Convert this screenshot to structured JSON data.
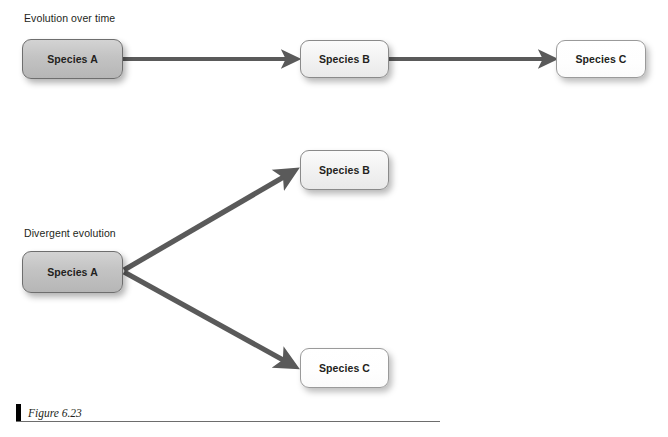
{
  "figure": {
    "caption": "Figure 6.23",
    "background_color": "#ffffff"
  },
  "colors": {
    "arrow": "#5a5a5a",
    "box_border_dark": "#6e6e6e",
    "box_border_light": "#9a9a9a",
    "box_fill_dark": "#c3c3c3",
    "box_fill_mid": "#f2f2f2",
    "box_fill_light": "#ffffff",
    "text": "#231f20",
    "caption_bar": "#000000",
    "caption_rule": "#6d6d6d"
  },
  "diagrams": [
    {
      "id": "linear-evolution",
      "label": "Evolution over time",
      "nodes": [
        {
          "id": "linear-species-a",
          "label": "Species A",
          "tone": "dark"
        },
        {
          "id": "linear-species-b",
          "label": "Species B",
          "tone": "mid"
        },
        {
          "id": "linear-species-c",
          "label": "Species C",
          "tone": "light"
        }
      ],
      "edges": [
        {
          "from": "Species A",
          "to": "Species B"
        },
        {
          "from": "Species B",
          "to": "Species C"
        }
      ]
    },
    {
      "id": "divergent-evolution",
      "label": "Divergent evolution",
      "nodes": [
        {
          "id": "divergent-species-a",
          "label": "Species A",
          "tone": "dark"
        },
        {
          "id": "divergent-species-b",
          "label": "Species B",
          "tone": "mid"
        },
        {
          "id": "divergent-species-c",
          "label": "Species C",
          "tone": "light"
        }
      ],
      "edges": [
        {
          "from": "Species A",
          "to": "Species B"
        },
        {
          "from": "Species A",
          "to": "Species C"
        }
      ]
    }
  ]
}
